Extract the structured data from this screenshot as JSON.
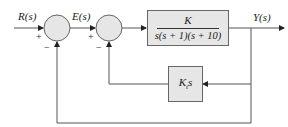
{
  "diagram": {
    "type": "control-block-diagram",
    "signals": {
      "input": "R(s)",
      "error": "E(s)",
      "output": "Y(s)"
    },
    "summing_junctions": [
      {
        "id": "sum1",
        "plus_sign": "+",
        "minus_sign": "−"
      },
      {
        "id": "sum2",
        "plus_sign": "+",
        "minus_sign": "−"
      }
    ],
    "blocks": {
      "forward": {
        "numerator": "K",
        "denominator": "s(s + 1)(s + 10)"
      },
      "feedback_inner": {
        "gain": "K",
        "subscript": "t",
        "variable": "s"
      }
    },
    "colors": {
      "line": "#555555",
      "block_fill": "#e6e6e6",
      "junction_fill": "#e6e6e6"
    }
  }
}
